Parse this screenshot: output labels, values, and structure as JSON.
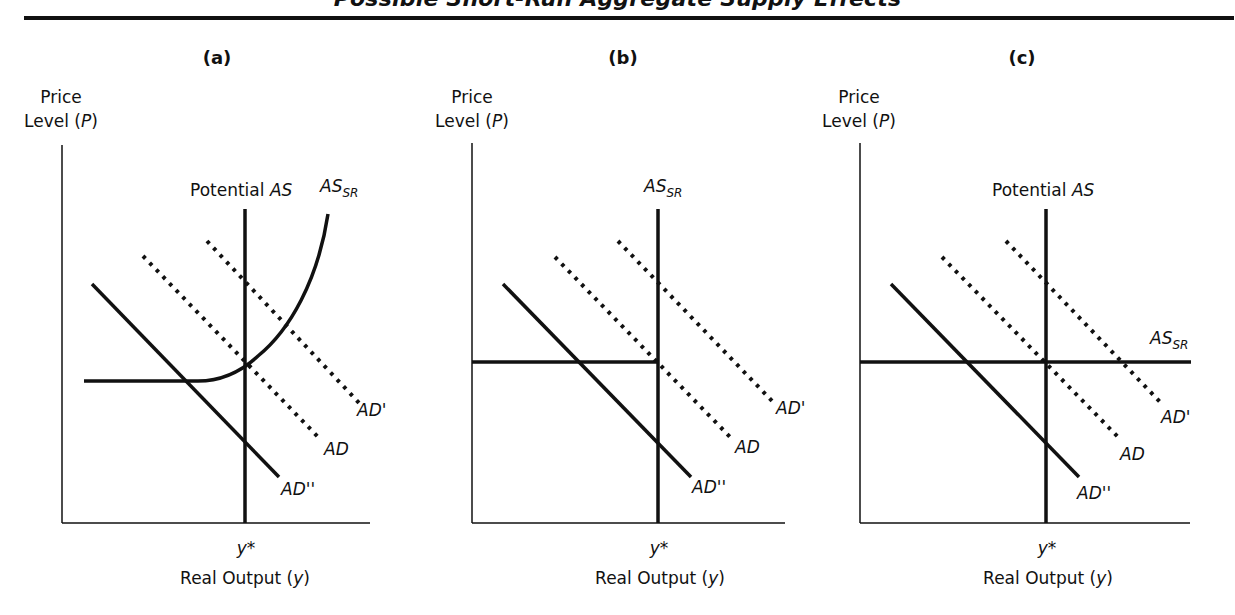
{
  "figure": {
    "title": "Possible Short-Run Aggregate Supply Effects"
  },
  "panels": [
    {
      "id": "a",
      "label": "(a)",
      "y_axis_label_line1": "Price",
      "y_axis_label_line2_prefix": "Level (",
      "y_axis_label_var": "P",
      "y_axis_label_suffix": ")",
      "x_axis_label_prefix": "Real Output (",
      "x_axis_label_var": "y",
      "x_axis_label_suffix": ")",
      "x_tick": "y*",
      "vertical_label_prefix": "Potential ",
      "vertical_label_var": "AS",
      "as_sr_main": "AS",
      "as_sr_sub": "SR",
      "ad_prime": "AD'",
      "ad": "AD",
      "ad_double_prime": "AD''"
    },
    {
      "id": "b",
      "label": "(b)",
      "y_axis_label_line1": "Price",
      "y_axis_label_line2_prefix": "Level (",
      "y_axis_label_var": "P",
      "y_axis_label_suffix": ")",
      "x_axis_label_prefix": "Real Output (",
      "x_axis_label_var": "y",
      "x_axis_label_suffix": ")",
      "x_tick": "y*",
      "as_sr_main": "AS",
      "as_sr_sub": "SR",
      "ad_prime": "AD'",
      "ad": "AD",
      "ad_double_prime": "AD''"
    },
    {
      "id": "c",
      "label": "(c)",
      "y_axis_label_line1": "Price",
      "y_axis_label_line2_prefix": "Level (",
      "y_axis_label_var": "P",
      "y_axis_label_suffix": ")",
      "x_axis_label_prefix": "Real Output (",
      "x_axis_label_var": "y",
      "x_axis_label_suffix": ")",
      "x_tick": "y*",
      "vertical_label_prefix": "Potential ",
      "vertical_label_var": "AS",
      "as_sr_main": "AS",
      "as_sr_sub": "SR",
      "ad_prime": "AD'",
      "ad": "AD",
      "ad_double_prime": "AD''"
    }
  ],
  "colors": {
    "ink": "#111111",
    "background": "#ffffff"
  }
}
